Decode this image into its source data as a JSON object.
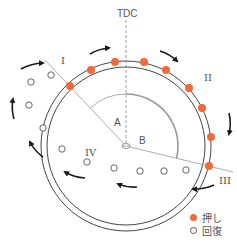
{
  "diagram": {
    "title_label": "TDC",
    "zone_labels": {
      "I": "I",
      "II": "II",
      "III": "III",
      "IV": "IV"
    },
    "angle_labels": {
      "A": "A",
      "B": "B"
    },
    "colors": {
      "push": "#f26a3a",
      "line": "#444444",
      "guide": "#999999",
      "arc": "#aaaaaa"
    },
    "center": [
      126,
      146
    ],
    "outer_radius": 85,
    "inner_radius": 79,
    "push_points": [
      [
        70,
        86
      ],
      [
        91,
        70
      ],
      [
        115,
        62
      ],
      [
        144,
        62
      ],
      [
        166,
        70
      ],
      [
        189,
        88
      ],
      [
        202,
        108
      ],
      [
        211,
        137
      ],
      [
        209,
        166
      ]
    ],
    "recovery_points": [
      [
        51,
        75
      ],
      [
        31,
        82
      ],
      [
        29,
        105
      ],
      [
        43,
        128
      ],
      [
        62,
        149
      ],
      [
        87,
        162
      ],
      [
        114,
        168
      ],
      [
        140,
        171
      ],
      [
        164,
        171
      ],
      [
        186,
        170
      ]
    ],
    "arrows": [
      {
        "from": [
          21,
          69
        ],
        "to": [
          43,
          63
        ]
      },
      {
        "from": [
          90,
          54
        ],
        "to": [
          109,
          48
        ]
      },
      {
        "from": [
          160,
          51
        ],
        "to": [
          177,
          61
        ]
      },
      {
        "from": [
          229,
          113
        ],
        "to": [
          229,
          134
        ]
      },
      {
        "from": [
          214,
          185
        ],
        "to": [
          193,
          189
        ]
      },
      {
        "from": [
          137,
          187
        ],
        "to": [
          118,
          184
        ]
      },
      {
        "from": [
          85,
          178
        ],
        "to": [
          65,
          172
        ]
      },
      {
        "from": [
          43,
          157
        ],
        "to": [
          30,
          142
        ]
      },
      {
        "from": [
          14,
          119
        ],
        "to": [
          13,
          99
        ]
      }
    ]
  },
  "legend": {
    "items": [
      {
        "type": "filled",
        "label": "押し"
      },
      {
        "type": "open",
        "label": "回復"
      }
    ]
  }
}
